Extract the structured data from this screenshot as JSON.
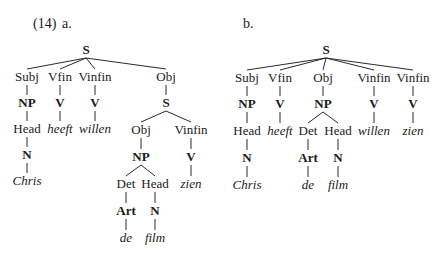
{
  "example": {
    "number": "(14)",
    "a_label": "a.",
    "b_label": "b."
  },
  "tree_a": {
    "nodes": [
      {
        "id": "S",
        "text": "S",
        "type": "cat",
        "x": 86,
        "y": 50
      },
      {
        "id": "Subj",
        "text": "Subj",
        "type": "fn",
        "x": 27,
        "y": 77
      },
      {
        "id": "Vfin",
        "text": "Vfin",
        "type": "fn",
        "x": 60,
        "y": 77
      },
      {
        "id": "Vinfin1",
        "text": "Vinfin",
        "type": "fn",
        "x": 95,
        "y": 77
      },
      {
        "id": "Obj",
        "text": "Obj",
        "type": "fn",
        "x": 166,
        "y": 77
      },
      {
        "id": "NP1",
        "text": "NP",
        "type": "cat",
        "x": 27,
        "y": 103
      },
      {
        "id": "V1",
        "text": "V",
        "type": "cat",
        "x": 60,
        "y": 103
      },
      {
        "id": "V2",
        "text": "V",
        "type": "cat",
        "x": 95,
        "y": 103
      },
      {
        "id": "S2",
        "text": "S",
        "type": "cat",
        "x": 166,
        "y": 103
      },
      {
        "id": "Head1",
        "text": "Head",
        "type": "fn",
        "x": 27,
        "y": 129
      },
      {
        "id": "heeft",
        "text": "heeft",
        "type": "word",
        "x": 60,
        "y": 129
      },
      {
        "id": "willen",
        "text": "willen",
        "type": "word",
        "x": 95,
        "y": 129
      },
      {
        "id": "Obj2",
        "text": "Obj",
        "type": "fn",
        "x": 141,
        "y": 130
      },
      {
        "id": "Vinfin2",
        "text": "Vinfin",
        "type": "fn",
        "x": 191,
        "y": 130
      },
      {
        "id": "N1",
        "text": "N",
        "type": "cat",
        "x": 27,
        "y": 155
      },
      {
        "id": "NP2",
        "text": "NP",
        "type": "cat",
        "x": 141,
        "y": 157
      },
      {
        "id": "V3",
        "text": "V",
        "type": "cat",
        "x": 191,
        "y": 157
      },
      {
        "id": "Chris",
        "text": "Chris",
        "type": "word",
        "x": 27,
        "y": 181
      },
      {
        "id": "Det",
        "text": "Det",
        "type": "fn",
        "x": 126,
        "y": 184
      },
      {
        "id": "Head2",
        "text": "Head",
        "type": "fn",
        "x": 155,
        "y": 184
      },
      {
        "id": "zien",
        "text": "zien",
        "type": "word",
        "x": 191,
        "y": 184
      },
      {
        "id": "Art",
        "text": "Art",
        "type": "cat",
        "x": 126,
        "y": 211
      },
      {
        "id": "N2",
        "text": "N",
        "type": "cat",
        "x": 155,
        "y": 211
      },
      {
        "id": "de",
        "text": "de",
        "type": "word",
        "x": 126,
        "y": 238
      },
      {
        "id": "film",
        "text": "film",
        "type": "word",
        "x": 155,
        "y": 238
      }
    ],
    "edges": [
      [
        "S",
        "Subj"
      ],
      [
        "S",
        "Vfin"
      ],
      [
        "S",
        "Vinfin1"
      ],
      [
        "S",
        "Obj"
      ],
      [
        "Subj",
        "NP1"
      ],
      [
        "Vfin",
        "V1"
      ],
      [
        "Vinfin1",
        "V2"
      ],
      [
        "Obj",
        "S2"
      ],
      [
        "NP1",
        "Head1"
      ],
      [
        "V1",
        "heeft"
      ],
      [
        "V2",
        "willen"
      ],
      [
        "S2",
        "Obj2"
      ],
      [
        "S2",
        "Vinfin2"
      ],
      [
        "Head1",
        "N1"
      ],
      [
        "Obj2",
        "NP2"
      ],
      [
        "Vinfin2",
        "V3"
      ],
      [
        "N1",
        "Chris"
      ],
      [
        "NP2",
        "Det"
      ],
      [
        "NP2",
        "Head2"
      ],
      [
        "V3",
        "zien"
      ],
      [
        "Det",
        "Art"
      ],
      [
        "Head2",
        "N2"
      ],
      [
        "Art",
        "de"
      ],
      [
        "N2",
        "film"
      ]
    ]
  },
  "tree_b": {
    "nodes": [
      {
        "id": "S",
        "text": "S",
        "type": "cat",
        "x": 326,
        "y": 50
      },
      {
        "id": "Subj",
        "text": "Subj",
        "type": "fn",
        "x": 247,
        "y": 78
      },
      {
        "id": "Vfin",
        "text": "Vfin",
        "type": "fn",
        "x": 280,
        "y": 78
      },
      {
        "id": "Obj",
        "text": "Obj",
        "type": "fn",
        "x": 323,
        "y": 78
      },
      {
        "id": "Vinfin1",
        "text": "Vinfin",
        "type": "fn",
        "x": 374,
        "y": 78
      },
      {
        "id": "Vinfin2",
        "text": "Vinfin",
        "type": "fn",
        "x": 413,
        "y": 78
      },
      {
        "id": "NP1",
        "text": "NP",
        "type": "cat",
        "x": 247,
        "y": 104
      },
      {
        "id": "V1",
        "text": "V",
        "type": "cat",
        "x": 280,
        "y": 104
      },
      {
        "id": "NP2",
        "text": "NP",
        "type": "cat",
        "x": 323,
        "y": 104
      },
      {
        "id": "V2",
        "text": "V",
        "type": "cat",
        "x": 374,
        "y": 104
      },
      {
        "id": "V3",
        "text": "V",
        "type": "cat",
        "x": 413,
        "y": 104
      },
      {
        "id": "Head1",
        "text": "Head",
        "type": "fn",
        "x": 247,
        "y": 131
      },
      {
        "id": "heeft",
        "text": "heeft",
        "type": "word",
        "x": 280,
        "y": 131
      },
      {
        "id": "Det",
        "text": "Det",
        "type": "fn",
        "x": 308,
        "y": 131
      },
      {
        "id": "Head2",
        "text": "Head",
        "type": "fn",
        "x": 338,
        "y": 131
      },
      {
        "id": "willen",
        "text": "willen",
        "type": "word",
        "x": 374,
        "y": 131
      },
      {
        "id": "zien",
        "text": "zien",
        "type": "word",
        "x": 413,
        "y": 131
      },
      {
        "id": "N1",
        "text": "N",
        "type": "cat",
        "x": 247,
        "y": 158
      },
      {
        "id": "Art",
        "text": "Art",
        "type": "cat",
        "x": 308,
        "y": 158
      },
      {
        "id": "N2",
        "text": "N",
        "type": "cat",
        "x": 338,
        "y": 158
      },
      {
        "id": "Chris",
        "text": "Chris",
        "type": "word",
        "x": 247,
        "y": 185
      },
      {
        "id": "de",
        "text": "de",
        "type": "word",
        "x": 308,
        "y": 185
      },
      {
        "id": "film",
        "text": "film",
        "type": "word",
        "x": 338,
        "y": 185
      }
    ],
    "edges": [
      [
        "S",
        "Subj"
      ],
      [
        "S",
        "Vfin"
      ],
      [
        "S",
        "Obj"
      ],
      [
        "S",
        "Vinfin1"
      ],
      [
        "S",
        "Vinfin2"
      ],
      [
        "Subj",
        "NP1"
      ],
      [
        "Vfin",
        "V1"
      ],
      [
        "Obj",
        "NP2"
      ],
      [
        "Vinfin1",
        "V2"
      ],
      [
        "Vinfin2",
        "V3"
      ],
      [
        "NP1",
        "Head1"
      ],
      [
        "V1",
        "heeft"
      ],
      [
        "NP2",
        "Det"
      ],
      [
        "NP2",
        "Head2"
      ],
      [
        "V2",
        "willen"
      ],
      [
        "V3",
        "zien"
      ],
      [
        "Head1",
        "N1"
      ],
      [
        "Det",
        "Art"
      ],
      [
        "Head2",
        "N2"
      ],
      [
        "N1",
        "Chris"
      ],
      [
        "Art",
        "de"
      ],
      [
        "N2",
        "film"
      ]
    ]
  }
}
